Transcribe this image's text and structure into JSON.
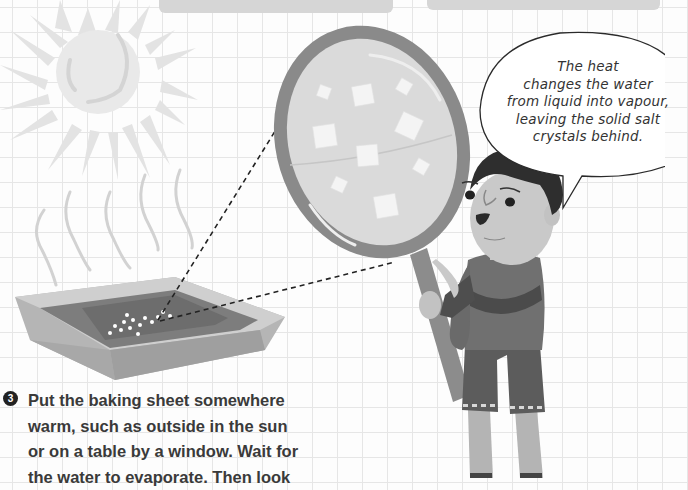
{
  "header": {
    "boxes": [
      {
        "name": "top-panel-left"
      },
      {
        "name": "top-panel-right"
      }
    ]
  },
  "illustration": {
    "sun": "sun-icon",
    "heat_waves": "heat-wave-icon",
    "tray": "baking-sheet",
    "magnifier": "magnifying-glass",
    "character": "boy",
    "colors": {
      "grid": "#e6e6e6",
      "sun": "#e8e8e8",
      "tray_outer": "#b3b3b3",
      "tray_inner": "#7e7e7e",
      "magnifier_rim": "#8a8a8a",
      "lens": "#d9d9d9",
      "hair": "#2e2e2e",
      "shirt": "#6e6e6e",
      "shorts": "#5a5a5a"
    }
  },
  "speech_bubble": {
    "lines": [
      "The heat",
      "changes the water",
      "from liquid into vapour,",
      "leaving the solid salt",
      "crystals behind."
    ]
  },
  "step": {
    "number": "3",
    "lines": [
      "Put the baking sheet somewhere",
      "warm, such as outside in the sun",
      "or on a table by a window. Wait for",
      "the water to evaporate. Then look"
    ]
  }
}
